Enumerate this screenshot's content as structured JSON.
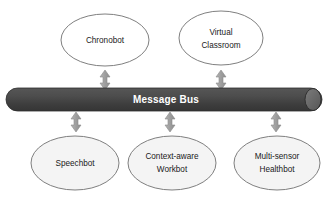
{
  "diagram": {
    "background_color": "#ffffff",
    "bus": {
      "label": "Message Bus",
      "fill_color": "#4a4a4a",
      "fill_color_dark": "#3a3a3a",
      "cap_color": "#6b6b6b",
      "text_color": "#ffffff"
    },
    "arrow": {
      "name": "bidirectional-arrow",
      "color": "#a6a6a6",
      "stroke_color": "#8c8c8c"
    },
    "top_nodes": [
      {
        "id": "chronobot",
        "label": "Chronobot",
        "lines": [
          "Chronobot"
        ],
        "fill_color": "#ffffff",
        "stroke_color": "#7f7f7f"
      },
      {
        "id": "virtual-classroom",
        "label": "Virtual Classroom",
        "lines": [
          "Virtual",
          "Classroom"
        ],
        "fill_color": "#ffffff",
        "stroke_color": "#7f7f7f"
      }
    ],
    "bottom_nodes": [
      {
        "id": "speechbot",
        "label": "Speechbot",
        "lines": [
          "Speechbot"
        ],
        "fill_color": "#f4f4f4",
        "stroke_color": "#7f7f7f"
      },
      {
        "id": "context-aware-workbot",
        "label": "Context-aware Workbot",
        "lines": [
          "Context-aware",
          "Workbot"
        ],
        "fill_color": "#f4f4f4",
        "stroke_color": "#7f7f7f"
      },
      {
        "id": "multi-sensor-healthbot",
        "label": "Multi-sensor Healthbot",
        "lines": [
          "Multi-sensor",
          "Healthbot"
        ],
        "fill_color": "#f4f4f4",
        "stroke_color": "#7f7f7f"
      }
    ],
    "connections": [
      {
        "from": "chronobot",
        "to": "message-bus",
        "type": "bidirectional"
      },
      {
        "from": "virtual-classroom",
        "to": "message-bus",
        "type": "bidirectional"
      },
      {
        "from": "message-bus",
        "to": "speechbot",
        "type": "bidirectional"
      },
      {
        "from": "message-bus",
        "to": "context-aware-workbot",
        "type": "bidirectional"
      },
      {
        "from": "message-bus",
        "to": "multi-sensor-healthbot",
        "type": "bidirectional"
      }
    ]
  }
}
